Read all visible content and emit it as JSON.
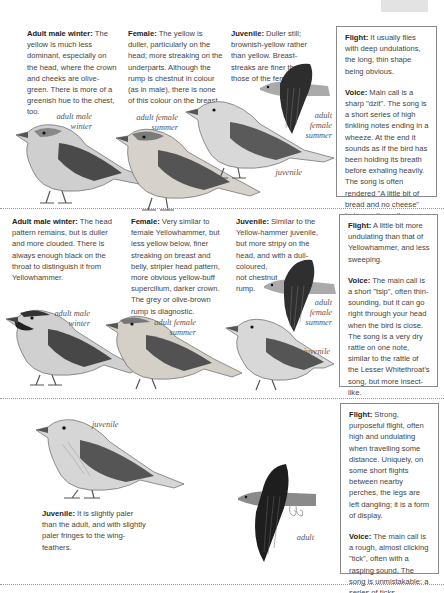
{
  "page": {
    "tab_marker_color": "#e3e3e3",
    "divider_color": "#9a9a9a"
  },
  "species1": {
    "adult_male_winter": {
      "heading": "Adult male winter:",
      "text": " The yellow is much less dominant, especially on the head, where the crown and cheeks are olive-green. There is more of a greenish hue to the chest, too."
    },
    "female": {
      "heading": "Female:",
      "text": " The yellow is duller, particularly on the head; more streaking on the underparts. Although the rump is chestnut in colour (as in male), there is none of this colour on the breast."
    },
    "juvenile": {
      "heading": "Juvenile:",
      "text": " Duller still; brownish-yellow rather than yellow. Breast-streaks are finer than those of the female."
    },
    "flight": {
      "heading": "Flight:",
      "text": " It usually flies with deep undulations, the long, thin shape being obvious."
    },
    "voice": {
      "heading": "Voice:",
      "text": " Main call is a sharp \"dzit\". The song is a short series of high tinkling notes ending in a wheeze. At the end it sounds as if the bird has been holding its breath before exhaling heavily. The song is often rendered \"A little bit of bread and no cheese\" but sometimes the \"cheese\" is lacking."
    },
    "labels": {
      "adult_male_winter": [
        "adult male",
        "winter"
      ],
      "adult_female_summer": [
        "adult female",
        "summer"
      ],
      "flying_adult_female_summer": [
        "adult",
        "female",
        "summer"
      ],
      "juvenile": "juvenile"
    }
  },
  "species2": {
    "adult_male_winter": {
      "heading": "Adult male winter:",
      "text": " The head pattern remains, but is duller and more clouded. There is always enough black on the throat to distinguish it from Yellowhammer."
    },
    "female": {
      "heading": "Female:",
      "text": " Very similar to female Yellowhammer, but less yellow below, finer streaking on breast and belly, stripier head pattern, more obvious yellow-buff supercilium, darker crown. The grey or olive-brown rump is diagnostic."
    },
    "juvenile": {
      "heading": "Juvenile:",
      "text": " Similar to the Yellow-hammer juvenile, but more stripy on the head, and with a dull-coloured,",
      "line2": "not chestnut",
      "line3": "rump."
    },
    "flight": {
      "heading": "Flight:",
      "text": " A little bit more undulating than that of Yellowhammer, and less sweeping."
    },
    "voice": {
      "heading": "Voice:",
      "text": " The main call is a short \"tsip\", often thin-sounding, but it can go right through your head when the bird is close. The song is a very dry rattle on one note, similar to the rattle of the Lesser Whitethroat's song, but more insect-like."
    },
    "labels": {
      "adult_male_winter": [
        "adult male",
        "winter"
      ],
      "adult_female_summer": [
        "adult female",
        "summer"
      ],
      "flying_adult_female_summer": [
        "adult",
        "female",
        "summer"
      ],
      "juvenile": "juvenile"
    }
  },
  "species3": {
    "juvenile": {
      "heading": "Juvenile:",
      "text": " It is slightly paler than the adult, and with slightly paler fringes to the wing-feathers."
    },
    "flight": {
      "heading": "Flight:",
      "text": " Strong, purposeful flight, often high and undulating when travelling some distance. Uniquely, on some short flights between nearby perches, the legs are left dangling; it is a form of display."
    },
    "voice": {
      "heading": "Voice:",
      "text": " The main call is a rough, almost clicking \"tick\", often with a rasping sound. The song is unmistakable: a series of ticks accelerates into a discordant jangle."
    },
    "labels": {
      "juvenile": "juvenile",
      "flying_adult": "adult"
    }
  }
}
